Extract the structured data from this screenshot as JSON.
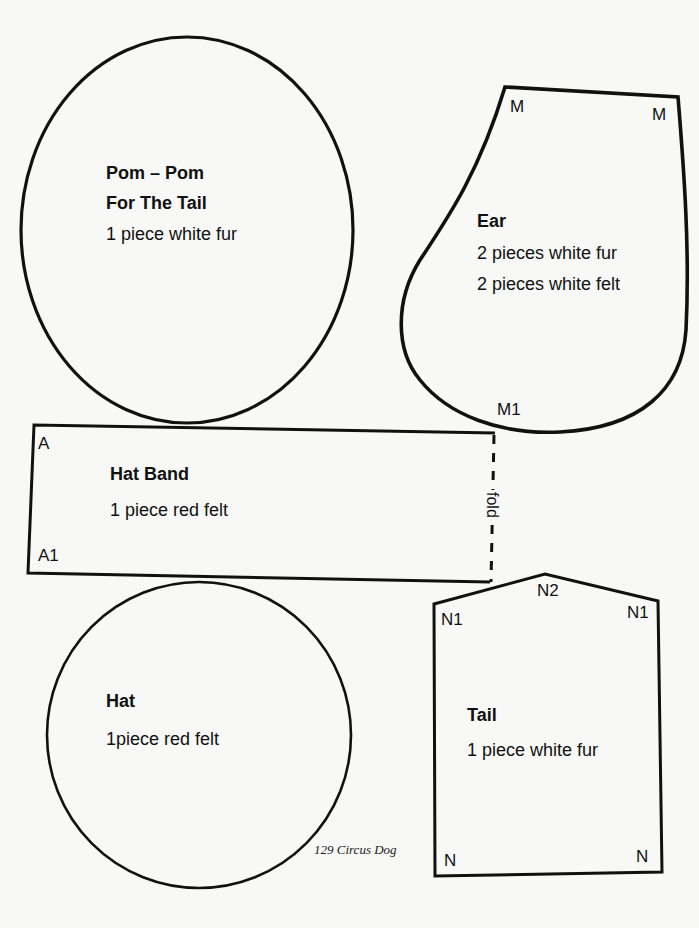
{
  "page": {
    "caption": "129 Circus Dog"
  },
  "pieces": {
    "pompom": {
      "title_line1": "Pom – Pom",
      "title_line2": "For The Tail",
      "instructions": "1 piece white fur"
    },
    "ear": {
      "title": "Ear",
      "instructions_line1": "2 pieces white fur",
      "instructions_line2": "2 pieces white felt",
      "marks": {
        "top_left": "M",
        "top_right": "M",
        "bottom": "M1"
      }
    },
    "hat_band": {
      "title": "Hat  Band",
      "instructions": "1 piece red felt",
      "marks": {
        "top_left": "A",
        "bottom_left": "A1"
      },
      "fold_label": "fold"
    },
    "hat": {
      "title": "Hat",
      "instructions": "1piece red felt"
    },
    "tail": {
      "title": "Tail",
      "instructions": "1 piece white fur",
      "marks": {
        "top_left": "N1",
        "top_center": "N2",
        "top_right": "N1",
        "bottom_left": "N",
        "bottom_right": "N"
      }
    }
  },
  "colors": {
    "paper": "#f8f8f6",
    "ink": "#111111"
  }
}
